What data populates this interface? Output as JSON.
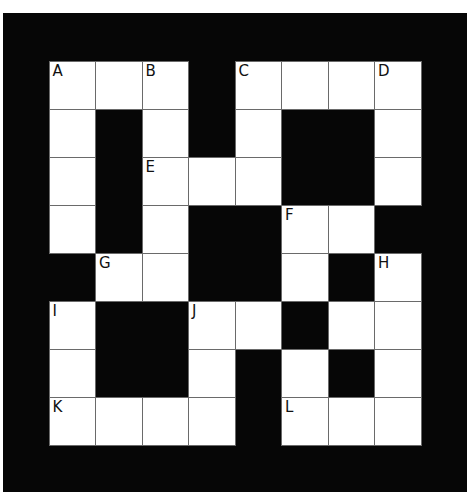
{
  "puzzle": {
    "type": "crossword",
    "rows": 8,
    "cols": 8,
    "colors": {
      "block": "#060606",
      "cell": "#ffffff",
      "grid_line": "#6a6a6a",
      "label": "#111111"
    },
    "layout": [
      "111.1111",
      "1.1.1..1",
      "1.111..1",
      "1.1..11.",
      ".11..1.1",
      "1..11.11",
      "1..1.1.1",
      "1111.111"
    ],
    "labels": [
      {
        "row": 0,
        "col": 0,
        "text": "A"
      },
      {
        "row": 0,
        "col": 2,
        "text": "B"
      },
      {
        "row": 0,
        "col": 4,
        "text": "C"
      },
      {
        "row": 0,
        "col": 7,
        "text": "D"
      },
      {
        "row": 2,
        "col": 2,
        "text": "E"
      },
      {
        "row": 3,
        "col": 5,
        "text": "F"
      },
      {
        "row": 4,
        "col": 1,
        "text": "G"
      },
      {
        "row": 4,
        "col": 7,
        "text": "H"
      },
      {
        "row": 5,
        "col": 0,
        "text": "I"
      },
      {
        "row": 5,
        "col": 3,
        "text": "J"
      },
      {
        "row": 7,
        "col": 0,
        "text": "K"
      },
      {
        "row": 7,
        "col": 5,
        "text": "L"
      }
    ]
  }
}
